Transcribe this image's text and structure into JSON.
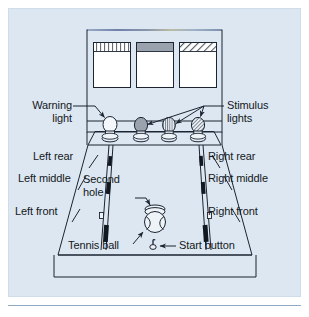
{
  "figure": {
    "background_color": "#dde7f2",
    "line_color": "#1b2430",
    "plate_border_color": "#c6d4e4",
    "rule_color": "#8fa8c4",
    "labels": {
      "warning_light": "Warning\nlight",
      "warning_light_line1": "Warning",
      "warning_light_line2": "light",
      "stimulus_lights_line1": "Stimulus",
      "stimulus_lights_line2": "lights",
      "left_rear": "Left rear",
      "left_middle": "Left middle",
      "left_front": "Left front",
      "right_rear": "Right rear",
      "right_middle": "Right middle",
      "right_front": "Right front",
      "second_hole_line1": "Second",
      "second_hole_line2": "hole",
      "tennis_ball": "Tennis ball",
      "start_button": "Start button"
    },
    "console": {
      "panel_count": 3,
      "panels": [
        {
          "name": "panel-left",
          "fill_pattern": "vertical-stripes",
          "fill": "#ffffff"
        },
        {
          "name": "panel-center",
          "fill_pattern": "solid-gray-band",
          "fill": "#9aa3ad"
        },
        {
          "name": "panel-right",
          "fill_pattern": "diagonal-hatch",
          "fill": "#ffffff"
        }
      ],
      "top_edge_accent": "#7d8fb5"
    },
    "lights": [
      {
        "name": "warning-light",
        "fill_pattern": "white",
        "fill": "#f4f8fc"
      },
      {
        "name": "stimulus-light-1",
        "fill_pattern": "solid-gray",
        "fill": "#9aa3ad"
      },
      {
        "name": "stimulus-light-2",
        "fill_pattern": "vertical-stripes",
        "fill": "#e9eef5"
      },
      {
        "name": "stimulus-light-3",
        "fill_pattern": "diagonal-hatch",
        "fill": "#e9eef5"
      }
    ],
    "runway": {
      "track_count": 2,
      "holes_per_track": 3,
      "hole_names": [
        "rear",
        "middle",
        "front"
      ],
      "hole_color": "#121820"
    },
    "objects": {
      "tennis_ball_color": "#eef3f8",
      "second_hole_color": "#eef3f8",
      "start_button_color": "#1b2430"
    }
  }
}
